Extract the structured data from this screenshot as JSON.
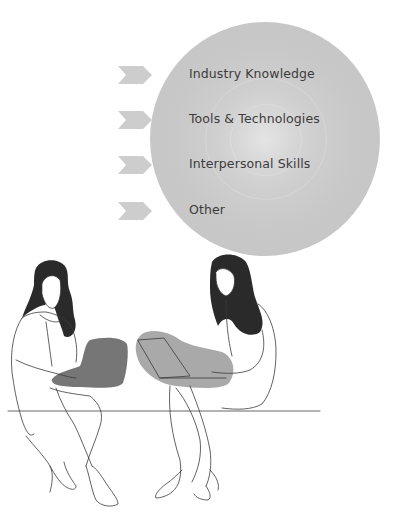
{
  "infographic": {
    "circle_color": "#c8c8c8",
    "chevron_color": "#cdcdcd",
    "text_color": "#3c3c3c",
    "items": [
      {
        "label": "Industry Knowledge",
        "icon": "chevron-right-icon"
      },
      {
        "label": "Tools & Technologies",
        "icon": "chevron-right-icon"
      },
      {
        "label": "Interpersonal Skills",
        "icon": "chevron-right-icon"
      },
      {
        "label": "Other",
        "icon": "chevron-right-icon"
      }
    ]
  },
  "illustration": {
    "description": "Two women sitting on a bench working on laptops",
    "left_laptop_blob_color": "#767676",
    "right_laptop_blob_color": "#a9a9a9",
    "hair_color": "#2a2a2a"
  }
}
